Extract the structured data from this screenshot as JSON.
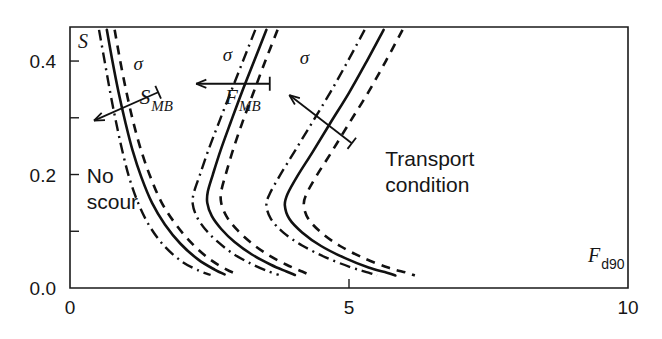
{
  "chart_data": {
    "type": "line",
    "title": "",
    "subtitle": "",
    "xlabel": "F",
    "xlabel_sub": "d90",
    "ylabel": "S",
    "ylabel_sub": "",
    "xlim": [
      0,
      10
    ],
    "ylim": [
      0.0,
      0.46
    ],
    "grid": false,
    "legend_position": "none",
    "xticks": [
      0,
      5,
      10
    ],
    "xtick_labels": [
      "0",
      "5",
      "10"
    ],
    "yticks": [
      0.0,
      0.1,
      0.2,
      0.3,
      0.4
    ],
    "ytick_labels": [
      "0.0",
      "",
      "0.2",
      "",
      "0.4"
    ],
    "xminor_ticks": [
      5
    ],
    "series": [
      {
        "name": "S_MB lower (sigma low)",
        "group": "S_MB",
        "style": "dashdot",
        "label": "",
        "points": [
          [
            0.52,
            0.455
          ],
          [
            0.62,
            0.4
          ],
          [
            0.72,
            0.345
          ],
          [
            0.82,
            0.295
          ],
          [
            0.93,
            0.245
          ],
          [
            1.06,
            0.195
          ],
          [
            1.22,
            0.15
          ],
          [
            1.42,
            0.11
          ],
          [
            1.68,
            0.075
          ],
          [
            2.0,
            0.047
          ],
          [
            2.32,
            0.03
          ],
          [
            2.52,
            0.023
          ]
        ]
      },
      {
        "name": "S_MB mean",
        "group": "S_MB",
        "style": "solid",
        "label": "",
        "points": [
          [
            0.66,
            0.455
          ],
          [
            0.76,
            0.4
          ],
          [
            0.87,
            0.345
          ],
          [
            0.99,
            0.293
          ],
          [
            1.12,
            0.243
          ],
          [
            1.28,
            0.195
          ],
          [
            1.47,
            0.15
          ],
          [
            1.7,
            0.112
          ],
          [
            1.98,
            0.078
          ],
          [
            2.3,
            0.05
          ],
          [
            2.6,
            0.032
          ],
          [
            2.77,
            0.024
          ]
        ]
      },
      {
        "name": "S_MB upper (sigma high)",
        "group": "S_MB",
        "style": "dashed",
        "label": "",
        "points": [
          [
            0.8,
            0.455
          ],
          [
            0.9,
            0.4
          ],
          [
            1.01,
            0.346
          ],
          [
            1.13,
            0.294
          ],
          [
            1.27,
            0.244
          ],
          [
            1.44,
            0.196
          ],
          [
            1.64,
            0.151
          ],
          [
            1.89,
            0.113
          ],
          [
            2.18,
            0.079
          ],
          [
            2.5,
            0.051
          ],
          [
            2.8,
            0.033
          ],
          [
            2.98,
            0.025
          ]
        ]
      },
      {
        "name": "F_MB lower (sigma low)",
        "group": "F_MB",
        "style": "dashdot",
        "label": "",
        "points": [
          [
            3.32,
            0.455
          ],
          [
            3.1,
            0.4
          ],
          [
            2.88,
            0.345
          ],
          [
            2.67,
            0.292
          ],
          [
            2.48,
            0.243
          ],
          [
            2.33,
            0.2
          ],
          [
            2.22,
            0.168
          ],
          [
            2.2,
            0.148
          ],
          [
            2.27,
            0.126
          ],
          [
            2.42,
            0.104
          ],
          [
            2.64,
            0.082
          ],
          [
            2.93,
            0.06
          ],
          [
            3.26,
            0.042
          ],
          [
            3.56,
            0.029
          ],
          [
            3.74,
            0.023
          ]
        ]
      },
      {
        "name": "F_MB mean",
        "group": "F_MB",
        "style": "solid",
        "label": "",
        "points": [
          [
            3.52,
            0.455
          ],
          [
            3.3,
            0.4
          ],
          [
            3.08,
            0.345
          ],
          [
            2.88,
            0.292
          ],
          [
            2.7,
            0.243
          ],
          [
            2.56,
            0.2
          ],
          [
            2.47,
            0.17
          ],
          [
            2.46,
            0.15
          ],
          [
            2.54,
            0.127
          ],
          [
            2.71,
            0.104
          ],
          [
            2.95,
            0.081
          ],
          [
            3.26,
            0.059
          ],
          [
            3.6,
            0.041
          ],
          [
            3.88,
            0.029
          ],
          [
            4.03,
            0.023
          ]
        ]
      },
      {
        "name": "F_MB upper (sigma high)",
        "group": "F_MB",
        "style": "dashed",
        "label": "",
        "points": [
          [
            3.72,
            0.455
          ],
          [
            3.5,
            0.4
          ],
          [
            3.29,
            0.345
          ],
          [
            3.09,
            0.292
          ],
          [
            2.92,
            0.243
          ],
          [
            2.79,
            0.2
          ],
          [
            2.71,
            0.17
          ],
          [
            2.71,
            0.15
          ],
          [
            2.8,
            0.127
          ],
          [
            2.98,
            0.104
          ],
          [
            3.23,
            0.081
          ],
          [
            3.54,
            0.059
          ],
          [
            3.88,
            0.041
          ],
          [
            4.16,
            0.029
          ],
          [
            4.3,
            0.023
          ]
        ]
      },
      {
        "name": "Transport lower (sigma low)",
        "group": "Transport",
        "style": "dashdot",
        "label": "",
        "points": [
          [
            5.28,
            0.455
          ],
          [
            4.98,
            0.4
          ],
          [
            4.66,
            0.344
          ],
          [
            4.33,
            0.29
          ],
          [
            4.02,
            0.24
          ],
          [
            3.76,
            0.198
          ],
          [
            3.58,
            0.166
          ],
          [
            3.52,
            0.146
          ],
          [
            3.6,
            0.122
          ],
          [
            3.82,
            0.098
          ],
          [
            4.16,
            0.075
          ],
          [
            4.58,
            0.054
          ],
          [
            5.02,
            0.037
          ],
          [
            5.35,
            0.027
          ],
          [
            5.5,
            0.022
          ]
        ]
      },
      {
        "name": "Transport mean",
        "group": "Transport",
        "style": "solid",
        "label": "",
        "points": [
          [
            5.62,
            0.455
          ],
          [
            5.32,
            0.4
          ],
          [
            5.0,
            0.344
          ],
          [
            4.66,
            0.29
          ],
          [
            4.35,
            0.24
          ],
          [
            4.08,
            0.198
          ],
          [
            3.9,
            0.166
          ],
          [
            3.85,
            0.146
          ],
          [
            3.93,
            0.122
          ],
          [
            4.16,
            0.098
          ],
          [
            4.5,
            0.074
          ],
          [
            4.92,
            0.053
          ],
          [
            5.35,
            0.036
          ],
          [
            5.68,
            0.027
          ],
          [
            5.83,
            0.022
          ]
        ]
      },
      {
        "name": "Transport upper (sigma high)",
        "group": "Transport",
        "style": "dashed",
        "label": "",
        "points": [
          [
            5.96,
            0.455
          ],
          [
            5.66,
            0.4
          ],
          [
            5.34,
            0.344
          ],
          [
            5.0,
            0.29
          ],
          [
            4.69,
            0.24
          ],
          [
            4.42,
            0.198
          ],
          [
            4.24,
            0.166
          ],
          [
            4.19,
            0.146
          ],
          [
            4.27,
            0.122
          ],
          [
            4.5,
            0.098
          ],
          [
            4.84,
            0.074
          ],
          [
            5.26,
            0.053
          ],
          [
            5.7,
            0.036
          ],
          [
            6.03,
            0.027
          ],
          [
            6.18,
            0.022
          ]
        ]
      }
    ],
    "curve_labels": [
      {
        "name": "s-mb-label",
        "text": "S",
        "sub": "MB",
        "x": 1.25,
        "y": 0.325
      },
      {
        "name": "f-mb-label",
        "text": "F",
        "sub": "MB",
        "x": 2.78,
        "y": 0.325
      }
    ],
    "region_labels": [
      {
        "name": "no-scour-label",
        "line1": "No",
        "line2": "scour",
        "x": 0.3,
        "y": 0.185
      },
      {
        "name": "transport-condition-label",
        "line1": "Transport",
        "line2": "condition",
        "x": 5.65,
        "y": 0.215
      }
    ],
    "annotations": [
      {
        "name": "sigma-arrow-s-mb",
        "symbol": "σ",
        "from": [
          1.58,
          0.345
        ],
        "to": [
          0.43,
          0.295
        ],
        "label_x": 1.22,
        "label_y": 0.385
      },
      {
        "name": "sigma-arrow-f-mb",
        "symbol": "σ",
        "from": [
          3.58,
          0.36
        ],
        "to": [
          2.26,
          0.36
        ],
        "label_x": 2.82,
        "label_y": 0.4
      },
      {
        "name": "sigma-arrow-transport",
        "symbol": "σ",
        "from": [
          5.05,
          0.255
        ],
        "to": [
          3.93,
          0.34
        ],
        "label_x": 4.2,
        "label_y": 0.395
      }
    ]
  },
  "figure": {
    "frame_color": "#1a1a1a",
    "curve_color": "#111111",
    "background": "#ffffff"
  }
}
